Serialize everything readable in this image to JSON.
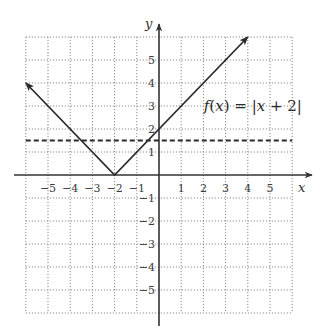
{
  "chart_data": {
    "type": "line",
    "title": "",
    "xlabel": "x",
    "ylabel": "y",
    "xlim": [
      -6,
      6
    ],
    "ylim": [
      -6,
      6
    ],
    "grid": true,
    "grid_style": "dotted",
    "x_ticks": [
      -5,
      -4,
      -3,
      -2,
      -1,
      1,
      2,
      3,
      4,
      5
    ],
    "y_ticks": [
      -5,
      -4,
      -3,
      -2,
      -1,
      1,
      2,
      3,
      4,
      5
    ],
    "x_tick_labels": [
      "−5",
      "−4",
      "−3",
      "−2",
      "−1",
      "1",
      "2",
      "3",
      "4",
      "5"
    ],
    "y_tick_labels": [
      "−5",
      "−4",
      "−3",
      "−2",
      "−1",
      "1",
      "2",
      "3",
      "4",
      "5"
    ],
    "series": [
      {
        "name": "f(x) = |x + 2|",
        "style": "solid",
        "arrows": "both",
        "x": [
          -6,
          -2,
          4
        ],
        "y": [
          4,
          0,
          6
        ]
      },
      {
        "name": "horizontal line",
        "style": "dashed",
        "x": [
          -6,
          6
        ],
        "y": [
          1.5,
          1.5
        ]
      }
    ],
    "annotations": [
      {
        "text": "f(x) = |x + 2|",
        "x": 4,
        "y": 3
      }
    ]
  },
  "labels": {
    "function_text_f": "f",
    "function_text_x": "x",
    "function_text_rest": ") = |",
    "function_text_x2": "x",
    "function_text_end": " + 2|"
  },
  "colors": {
    "line": "#2a2a2a",
    "grid": "#8a8a8a",
    "axis": "#333333"
  }
}
